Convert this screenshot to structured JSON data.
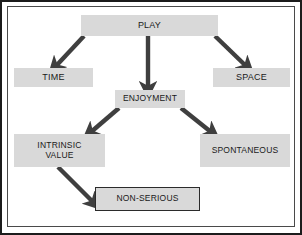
{
  "diagram": {
    "title_text": "Play concept map",
    "palette": {
      "node_fill": "#d9d9d9",
      "node_text": "#1a1a1a",
      "arrow": "#3f3f3f",
      "frame": "#4a4a4a",
      "edge": "#1c1c1c",
      "background": "#ffffff"
    },
    "nodes": [
      {
        "id": "play",
        "label": "PLAY",
        "x": 81,
        "y": 15,
        "w": 137,
        "h": 21,
        "bordered": false,
        "font_size": 9
      },
      {
        "id": "time",
        "label": "TIME",
        "x": 14,
        "y": 68,
        "w": 79,
        "h": 19,
        "bordered": false,
        "font_size": 9
      },
      {
        "id": "space",
        "label": "SPACE",
        "x": 213,
        "y": 68,
        "w": 77,
        "h": 19,
        "bordered": false,
        "font_size": 9
      },
      {
        "id": "enjoyment",
        "label": "ENJOYMENT",
        "x": 115,
        "y": 90,
        "w": 70,
        "h": 18,
        "bordered": false,
        "font_size": 8.5
      },
      {
        "id": "intrinsic",
        "label": "INTRINSIC\nVALUE",
        "x": 14,
        "y": 134,
        "w": 91,
        "h": 33,
        "bordered": false,
        "font_size": 8.5
      },
      {
        "id": "spontaneous",
        "label": "SPONTANEOUS",
        "x": 200,
        "y": 134,
        "w": 90,
        "h": 33,
        "bordered": false,
        "font_size": 8.5
      },
      {
        "id": "nonserious",
        "label": "NON-SERIOUS",
        "x": 95,
        "y": 187,
        "w": 105,
        "h": 24,
        "bordered": true,
        "font_size": 8.5
      }
    ],
    "edges": [
      {
        "id": "play-to-time",
        "from": "play",
        "to": "time",
        "x1": 84,
        "y1": 36,
        "x2": 56,
        "y2": 66
      },
      {
        "id": "play-to-enjoyment",
        "from": "play",
        "to": "enjoyment",
        "x1": 148,
        "y1": 36,
        "x2": 148,
        "y2": 88
      },
      {
        "id": "play-to-space",
        "from": "play",
        "to": "space",
        "x1": 215,
        "y1": 36,
        "x2": 246,
        "y2": 66
      },
      {
        "id": "enjoyment-to-intrinsic",
        "from": "enjoyment",
        "to": "intrinsic",
        "x1": 119,
        "y1": 108,
        "x2": 91,
        "y2": 132
      },
      {
        "id": "enjoyment-to-spontaneous",
        "from": "enjoyment",
        "to": "spontaneous",
        "x1": 181,
        "y1": 108,
        "x2": 211,
        "y2": 132
      },
      {
        "id": "intrinsic-to-nonserious",
        "from": "intrinsic",
        "to": "nonserious",
        "x1": 58,
        "y1": 167,
        "x2": 93,
        "y2": 202
      }
    ]
  }
}
